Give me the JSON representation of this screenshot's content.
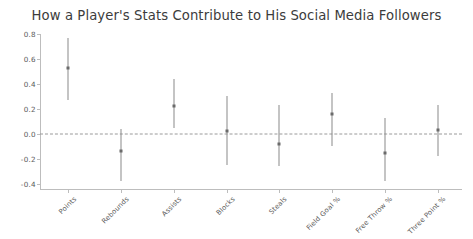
{
  "chart_data": {
    "type": "scatter",
    "title": "How a Player's Stats Contribute to His Social Media Followers",
    "xlabel": "",
    "ylabel": "",
    "ylim": [
      -0.45,
      0.85
    ],
    "yticks": [
      "0.8",
      "0.6",
      "0.4",
      "0.2",
      "0.0",
      "-0.2",
      "-0.4"
    ],
    "ytick_values": [
      0.8,
      0.6,
      0.4,
      0.2,
      0.0,
      -0.2,
      -0.4
    ],
    "grid": false,
    "legend": "none",
    "zero_reference_line": 0.0,
    "categories": [
      "Points",
      "Rebounds",
      "Assists",
      "Blocks",
      "Steals",
      "Field Goal %",
      "Free Throw %",
      "Three Point %"
    ],
    "values": [
      0.53,
      -0.14,
      0.22,
      0.02,
      -0.08,
      0.16,
      -0.15,
      0.03
    ],
    "error_low": [
      0.27,
      -0.38,
      0.05,
      -0.25,
      -0.26,
      -0.1,
      -0.38,
      -0.18
    ],
    "error_high": [
      0.77,
      0.04,
      0.44,
      0.3,
      0.23,
      0.33,
      0.13,
      0.23
    ],
    "series": [
      {
        "name": "Coefficient estimate",
        "values": [
          0.53,
          -0.14,
          0.22,
          0.02,
          -0.08,
          0.16,
          -0.15,
          0.03
        ]
      }
    ]
  },
  "colors": {
    "background": "#ffffff",
    "errorbar": "#8a8a8a",
    "marker": "#6b6b6b",
    "axis": "#bdbdbd",
    "zero_line": "#9a9a9a",
    "text": "#4a4a4a"
  }
}
